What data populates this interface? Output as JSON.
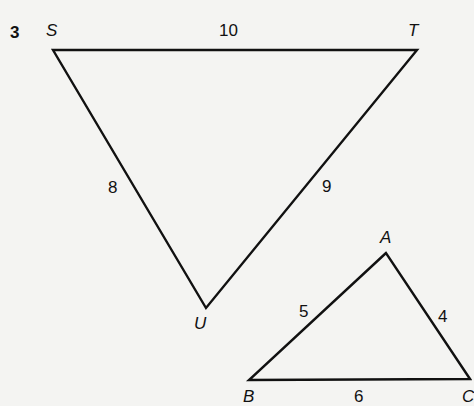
{
  "question_number": "3",
  "triangle_STU": {
    "vertices": {
      "S": "S",
      "T": "T",
      "U": "U"
    },
    "sides": {
      "ST": "10",
      "SU": "8",
      "TU": "9"
    }
  },
  "triangle_ABC": {
    "vertices": {
      "A": "A",
      "B": "B",
      "C": "C"
    },
    "sides": {
      "AB": "5",
      "AC": "4",
      "BC": "6"
    }
  },
  "colors": {
    "line": "#111111",
    "background": "#f4f4f2"
  }
}
